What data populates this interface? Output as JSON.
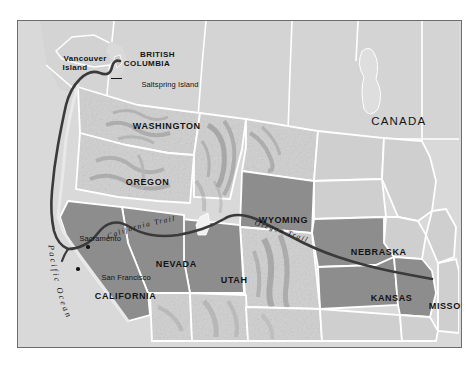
{
  "figure": {
    "kind": "historical-route-map"
  },
  "colors": {
    "page_background": "#ffffff",
    "frame_border": "#6d6d6d",
    "ocean": "#d9d9d9",
    "canada_fill": "#d4d4d4",
    "state_light_fill": "#cfcfcf",
    "state_highlight_fill": "#8d8d8d",
    "state_border": "#ffffff",
    "trail_line": "#3a3a3a",
    "label_text": "#141414"
  },
  "labels": {
    "country": [
      {
        "id": "canada",
        "text": "CANADA",
        "x": 318,
        "y": 88
      }
    ],
    "regions": [
      {
        "id": "british-columbia",
        "text": "BRITISH\nCOLUMBIA",
        "x": 98,
        "y": 24
      }
    ],
    "islands": [
      {
        "id": "vancouver-island",
        "text": "Vancouver\nIsland",
        "x": 24,
        "y": 30
      },
      {
        "id": "saltspring-island",
        "text": "Saltspring Island",
        "x": 104,
        "y": 57
      }
    ],
    "states": [
      {
        "id": "washington",
        "text": "WASHINGTON",
        "x": 90,
        "y": 97
      },
      {
        "id": "oregon",
        "text": "OREGON",
        "x": 83,
        "y": 152
      },
      {
        "id": "california",
        "text": "CALIFORNIA",
        "x": 58,
        "y": 267
      },
      {
        "id": "nevada",
        "text": "NEVADA",
        "x": 113,
        "y": 234
      },
      {
        "id": "utah",
        "text": "UTAH",
        "x": 178,
        "y": 250
      },
      {
        "id": "wyoming",
        "text": "WYOMING",
        "x": 224,
        "y": 191
      },
      {
        "id": "nebraska",
        "text": "NEBRASKA",
        "x": 316,
        "y": 223
      },
      {
        "id": "kansas",
        "text": "KANSAS",
        "x": 333,
        "y": 268
      },
      {
        "id": "missouri",
        "text": "MISSOURI",
        "x": 404,
        "y": 277
      }
    ],
    "cities": [
      {
        "id": "sacramento",
        "text": "Sacramento",
        "label_x": 46,
        "label_y": 213,
        "dot_x": 70,
        "dot_y": 227
      },
      {
        "id": "san-francisco",
        "text": "San Francisco",
        "label_x": 68,
        "label_y": 251,
        "dot_x": 62,
        "dot_y": 250
      }
    ],
    "trails": [
      {
        "id": "california-trail",
        "text": "California Trail"
      },
      {
        "id": "oregon-trail",
        "text": "Oregon Trail"
      }
    ],
    "water": [
      {
        "id": "pacific-ocean",
        "text": "Pacific Ocean"
      }
    ]
  },
  "trail_route": {
    "name": "Oregon Trail / California Trail",
    "start": "Missouri",
    "end_branches": [
      "California (Sacramento / San Francisco)",
      "Vancouver Island (Saltspring Island)"
    ]
  }
}
